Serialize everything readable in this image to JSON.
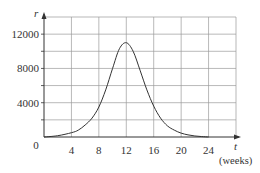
{
  "chart_data": {
    "type": "line",
    "title": "",
    "xlabel": "t",
    "xlabel_unit": "(weeks)",
    "ylabel": "r",
    "xlim": [
      0,
      28
    ],
    "ylim": [
      0,
      14000
    ],
    "grid": true,
    "x_ticks": [
      0,
      4,
      8,
      12,
      16,
      20,
      24
    ],
    "x_tick_labels": [
      "0",
      "4",
      "8",
      "12",
      "16",
      "20",
      "24"
    ],
    "y_ticks": [
      4000,
      8000,
      12000
    ],
    "y_tick_labels": [
      "4000",
      "8000",
      "12000"
    ],
    "x_grid_step": 4,
    "y_grid_step": 2000,
    "series": [
      {
        "name": "r(t)",
        "x": [
          0,
          2,
          4,
          5,
          6,
          7,
          8,
          9,
          10,
          11,
          12,
          13,
          14,
          15,
          16,
          17,
          18,
          19,
          20,
          21,
          22,
          23,
          24
        ],
        "values": [
          0,
          150,
          500,
          800,
          1400,
          2200,
          3500,
          5500,
          8000,
          10300,
          11000,
          10000,
          7800,
          5500,
          3600,
          2200,
          1300,
          800,
          450,
          250,
          120,
          50,
          0
        ]
      }
    ]
  },
  "labels": {
    "origin": "0",
    "x_axis": "t",
    "x_unit": "(weeks)",
    "y_axis": "r"
  },
  "colors": {
    "grid": "#9a9a9a",
    "axis": "#333333",
    "curve": "#333333"
  }
}
